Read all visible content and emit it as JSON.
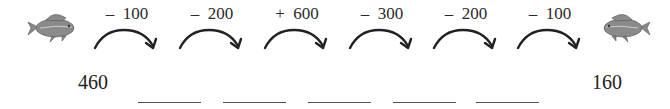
{
  "start_value": "460",
  "end_value": "160",
  "operations": [
    {
      "sign": "–",
      "amount": "100"
    },
    {
      "sign": "–",
      "amount": "200"
    },
    {
      "sign": "+",
      "amount": "600"
    },
    {
      "sign": "–",
      "amount": "300"
    },
    {
      "sign": "–",
      "amount": "200"
    },
    {
      "sign": "–",
      "amount": "100"
    }
  ],
  "answer_blanks": 5,
  "icons": {
    "left": "fish-icon",
    "right": "fish-icon",
    "step": "curved-arrow-right-icon"
  }
}
